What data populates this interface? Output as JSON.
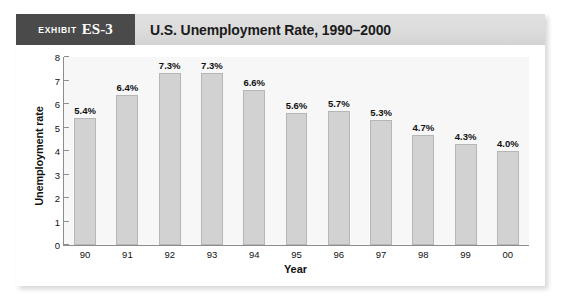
{
  "exhibit": {
    "badge_word": "Exhibit",
    "badge_number": "ES-3",
    "title": "U.S. Unemployment Rate, 1990–2000"
  },
  "colors": {
    "badge_bg": "#4a4a4a",
    "header_bg": "#dcdcdc",
    "bar_fill": "#d2d2d2",
    "bar_border": "#b6b6b6",
    "axis": "#8d8d8d",
    "plot_bg": "#f7f7f7",
    "text": "#111111"
  },
  "chart_data": {
    "type": "bar",
    "title": "U.S. Unemployment Rate, 1990–2000",
    "xlabel": "Year",
    "ylabel": "Unemployment rate",
    "ylim": [
      0,
      8
    ],
    "yticks": [
      0,
      1,
      2,
      3,
      4,
      5,
      6,
      7,
      8
    ],
    "ytick_labels": [
      "0",
      "1",
      "2",
      "3",
      "4",
      "5",
      "6",
      "7",
      "8"
    ],
    "grid": false,
    "legend": null,
    "categories": [
      "90",
      "91",
      "92",
      "93",
      "94",
      "95",
      "96",
      "97",
      "98",
      "99",
      "00"
    ],
    "values": [
      5.4,
      6.4,
      7.3,
      7.3,
      6.6,
      5.6,
      5.7,
      5.3,
      4.7,
      4.3,
      4.0
    ],
    "data_labels": [
      "5.4%",
      "6.4%",
      "7.3%",
      "7.3%",
      "6.6%",
      "5.6%",
      "5.7%",
      "5.3%",
      "4.7%",
      "4.3%",
      "4.0%"
    ]
  }
}
